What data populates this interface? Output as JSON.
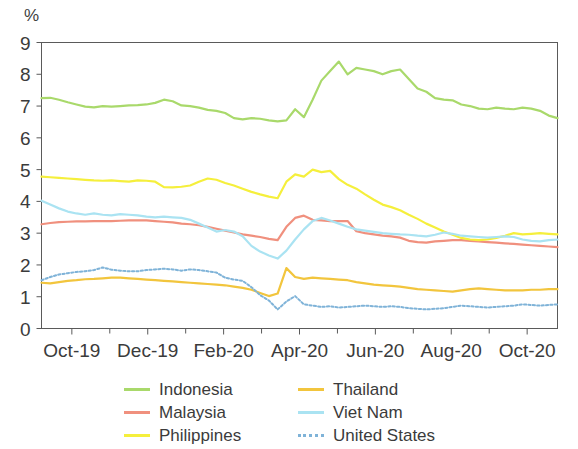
{
  "chart_data": {
    "type": "line",
    "title": "",
    "subtitle": "",
    "xlabel": "",
    "ylabel": "%",
    "unit_label": "%",
    "ylim": [
      0,
      9
    ],
    "yticks": [
      0,
      1,
      2,
      3,
      4,
      5,
      6,
      7,
      8,
      9
    ],
    "ytick_labels": [
      "0",
      "1",
      "2",
      "3",
      "4",
      "5",
      "6",
      "7",
      "8",
      "9"
    ],
    "grid": false,
    "legend_position": "bottom",
    "legend_columns": 2,
    "x_range_start": "Sep-19",
    "x_range_end": "Nov-20",
    "xtick_labels": [
      "Oct-19",
      "Dec-19",
      "Feb-20",
      "Apr-20",
      "Jun-20",
      "Aug-20",
      "Oct-20"
    ],
    "x_minor_ticks_between": 1,
    "x": [
      "2019-09-16",
      "2019-09-23",
      "2019-09-30",
      "2019-10-07",
      "2019-10-14",
      "2019-10-21",
      "2019-10-28",
      "2019-11-04",
      "2019-11-11",
      "2019-11-18",
      "2019-11-25",
      "2019-12-02",
      "2019-12-09",
      "2019-12-16",
      "2019-12-23",
      "2019-12-30",
      "2020-01-06",
      "2020-01-13",
      "2020-01-20",
      "2020-01-27",
      "2020-02-03",
      "2020-02-10",
      "2020-02-17",
      "2020-02-24",
      "2020-03-02",
      "2020-03-09",
      "2020-03-16",
      "2020-03-23",
      "2020-03-30",
      "2020-04-06",
      "2020-04-13",
      "2020-04-20",
      "2020-04-27",
      "2020-05-04",
      "2020-05-11",
      "2020-05-18",
      "2020-05-25",
      "2020-06-01",
      "2020-06-08",
      "2020-06-15",
      "2020-06-22",
      "2020-06-29",
      "2020-07-06",
      "2020-07-13",
      "2020-07-20",
      "2020-07-27",
      "2020-08-03",
      "2020-08-10",
      "2020-08-17",
      "2020-08-24",
      "2020-08-31",
      "2020-09-07",
      "2020-09-14",
      "2020-09-21",
      "2020-09-28",
      "2020-10-05",
      "2020-10-12",
      "2020-10-19",
      "2020-10-26",
      "2020-11-02"
    ],
    "series": [
      {
        "name": "Indonesia",
        "color": "#a9d96b",
        "style": "solid",
        "values": [
          7.25,
          7.26,
          7.2,
          7.12,
          7.05,
          6.98,
          6.96,
          7.0,
          6.98,
          7.0,
          7.02,
          7.03,
          7.05,
          7.1,
          7.2,
          7.15,
          7.02,
          7.0,
          6.95,
          6.88,
          6.85,
          6.78,
          6.62,
          6.58,
          6.62,
          6.6,
          6.55,
          6.52,
          6.55,
          6.9,
          6.65,
          7.2,
          7.8,
          8.1,
          8.4,
          8.0,
          8.2,
          8.15,
          8.1,
          8.0,
          8.1,
          8.15,
          7.85,
          7.55,
          7.45,
          7.25,
          7.2,
          7.18,
          7.05,
          7.0,
          6.92,
          6.9,
          6.95,
          6.92,
          6.9,
          6.95,
          6.92,
          6.85,
          6.7,
          6.62
        ]
      },
      {
        "name": "Malaysia",
        "color": "#f0907e",
        "style": "solid",
        "values": [
          3.28,
          3.32,
          3.35,
          3.36,
          3.37,
          3.37,
          3.38,
          3.38,
          3.38,
          3.39,
          3.4,
          3.4,
          3.4,
          3.38,
          3.36,
          3.34,
          3.3,
          3.28,
          3.25,
          3.2,
          3.14,
          3.08,
          3.02,
          2.96,
          2.92,
          2.88,
          2.82,
          2.78,
          3.2,
          3.48,
          3.55,
          3.42,
          3.4,
          3.38,
          3.38,
          3.38,
          3.06,
          3.0,
          2.96,
          2.92,
          2.9,
          2.86,
          2.76,
          2.72,
          2.7,
          2.74,
          2.76,
          2.78,
          2.78,
          2.76,
          2.74,
          2.72,
          2.7,
          2.68,
          2.66,
          2.64,
          2.62,
          2.6,
          2.58,
          2.56
        ]
      },
      {
        "name": "Philippines",
        "color": "#f5ef3c",
        "style": "solid",
        "values": [
          4.78,
          4.76,
          4.74,
          4.72,
          4.7,
          4.68,
          4.66,
          4.65,
          4.66,
          4.64,
          4.62,
          4.66,
          4.65,
          4.62,
          4.45,
          4.44,
          4.46,
          4.5,
          4.62,
          4.72,
          4.68,
          4.58,
          4.5,
          4.4,
          4.3,
          4.22,
          4.15,
          4.1,
          4.62,
          4.85,
          4.78,
          5.0,
          4.92,
          4.96,
          4.7,
          4.52,
          4.4,
          4.22,
          4.05,
          3.9,
          3.82,
          3.72,
          3.58,
          3.45,
          3.3,
          3.18,
          3.05,
          2.95,
          2.85,
          2.8,
          2.78,
          2.8,
          2.85,
          2.92,
          3.0,
          2.96,
          2.98,
          3.0,
          2.98,
          2.96
        ]
      },
      {
        "name": "Thailand",
        "color": "#f2c53d",
        "style": "solid",
        "values": [
          1.44,
          1.42,
          1.46,
          1.5,
          1.52,
          1.55,
          1.56,
          1.58,
          1.6,
          1.6,
          1.58,
          1.56,
          1.54,
          1.52,
          1.5,
          1.48,
          1.46,
          1.44,
          1.42,
          1.4,
          1.38,
          1.36,
          1.32,
          1.28,
          1.22,
          1.12,
          1.02,
          1.1,
          1.9,
          1.62,
          1.56,
          1.6,
          1.58,
          1.56,
          1.54,
          1.52,
          1.46,
          1.42,
          1.38,
          1.36,
          1.34,
          1.32,
          1.28,
          1.24,
          1.22,
          1.2,
          1.18,
          1.16,
          1.2,
          1.24,
          1.26,
          1.24,
          1.22,
          1.2,
          1.2,
          1.2,
          1.22,
          1.22,
          1.24,
          1.24
        ]
      },
      {
        "name": "Viet Nam",
        "color": "#aae3f2",
        "style": "solid",
        "values": [
          4.02,
          3.9,
          3.78,
          3.68,
          3.62,
          3.58,
          3.62,
          3.58,
          3.56,
          3.6,
          3.58,
          3.56,
          3.52,
          3.5,
          3.52,
          3.5,
          3.48,
          3.42,
          3.3,
          3.18,
          3.05,
          3.1,
          3.05,
          2.9,
          2.6,
          2.42,
          2.3,
          2.2,
          2.45,
          2.8,
          3.12,
          3.38,
          3.48,
          3.4,
          3.3,
          3.2,
          3.12,
          3.08,
          3.04,
          3.0,
          2.98,
          2.96,
          2.95,
          2.92,
          2.9,
          2.95,
          3.02,
          2.98,
          2.92,
          2.9,
          2.88,
          2.86,
          2.88,
          2.9,
          2.88,
          2.8,
          2.76,
          2.74,
          2.78,
          2.8
        ]
      },
      {
        "name": "United States",
        "color": "#7fb3d8",
        "style": "dotted",
        "values": [
          1.52,
          1.62,
          1.7,
          1.74,
          1.78,
          1.8,
          1.84,
          1.92,
          1.85,
          1.82,
          1.8,
          1.8,
          1.84,
          1.86,
          1.88,
          1.86,
          1.82,
          1.86,
          1.84,
          1.8,
          1.76,
          1.6,
          1.54,
          1.5,
          1.3,
          1.05,
          0.88,
          0.6,
          0.85,
          1.02,
          0.76,
          0.72,
          0.68,
          0.7,
          0.66,
          0.68,
          0.7,
          0.72,
          0.7,
          0.68,
          0.7,
          0.68,
          0.64,
          0.62,
          0.6,
          0.62,
          0.64,
          0.68,
          0.72,
          0.7,
          0.68,
          0.66,
          0.68,
          0.7,
          0.72,
          0.76,
          0.74,
          0.72,
          0.74,
          0.76
        ]
      }
    ]
  },
  "legend": {
    "items": [
      {
        "label": "Indonesia",
        "color": "#a9d96b",
        "style": "solid",
        "name": "legend-item-indonesia"
      },
      {
        "label": "Thailand",
        "color": "#f2c53d",
        "style": "solid",
        "name": "legend-item-thailand"
      },
      {
        "label": "Malaysia",
        "color": "#f0907e",
        "style": "solid",
        "name": "legend-item-malaysia"
      },
      {
        "label": "Viet Nam",
        "color": "#aae3f2",
        "style": "solid",
        "name": "legend-item-viet-nam"
      },
      {
        "label": "Philippines",
        "color": "#f5ef3c",
        "style": "solid",
        "name": "legend-item-philippines"
      },
      {
        "label": "United States",
        "color": "#7fb3d8",
        "style": "dotted",
        "name": "legend-item-united-states"
      }
    ]
  },
  "axis_color": "#5a5a5a",
  "text_color": "#3b3b3b"
}
